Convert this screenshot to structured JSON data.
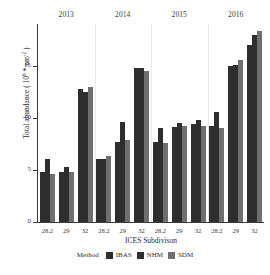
{
  "chart_data": {
    "type": "bar",
    "title": "",
    "subtitle": "",
    "xlabel": "ICES Subdivison",
    "ylabel": "Total abundance ( 10^6 * nm^-2 )",
    "ylabel_parts": {
      "prefix": "Total abundance ( 10",
      "exp1": "6",
      "mid": " * nm",
      "exp2": "-2",
      "suffix": " )"
    },
    "ylim": [
      0,
      19
    ],
    "yticks": [
      0,
      5,
      10,
      15
    ],
    "ytick_labels": [
      "0",
      "5",
      "10",
      "15"
    ],
    "grid": false,
    "legend_position": "bottom",
    "legend_title": "Method",
    "panels": [
      "2013",
      "2014",
      "2015",
      "2016"
    ],
    "categories": [
      "28.2",
      "29",
      "32"
    ],
    "series": [
      {
        "name": "IBAS",
        "color": "#2e2e2e",
        "values": {
          "2013": [
            4.8,
            4.8,
            12.8
          ],
          "2014": [
            6.0,
            7.7,
            14.8
          ],
          "2015": [
            7.7,
            9.1,
            9.4
          ],
          "2016": [
            9.2,
            15.0,
            17.0
          ]
        }
      },
      {
        "name": "NHM",
        "color": "#2e2e2e",
        "values": {
          "2013": [
            6.0,
            5.3,
            12.5
          ],
          "2014": [
            6.0,
            9.6,
            14.8
          ],
          "2015": [
            9.0,
            9.5,
            9.8
          ],
          "2016": [
            10.6,
            15.1,
            17.9
          ]
        }
      },
      {
        "name": "SDM",
        "color": "#6f6f6f",
        "values": {
          "2013": [
            4.6,
            4.8,
            13.0
          ],
          "2014": [
            6.3,
            7.9,
            14.5
          ],
          "2015": [
            7.6,
            9.2,
            9.2
          ],
          "2016": [
            9.0,
            15.5,
            18.3
          ]
        }
      }
    ]
  },
  "legend": {
    "title": "Method",
    "items": [
      {
        "label": "IBAS",
        "color": "#2e2e2e"
      },
      {
        "label": "NHM",
        "color": "#2e2e2e"
      },
      {
        "label": "SDM",
        "color": "#6f6f6f"
      }
    ]
  },
  "axes": {
    "x_title": "ICES Subdivison",
    "y_ticks": [
      "0",
      "5",
      "10",
      "15"
    ],
    "x_ticks_per_panel": [
      "28.2",
      "29",
      "32"
    ]
  },
  "panel_labels": [
    "2013",
    "2014",
    "2015",
    "2016"
  ]
}
